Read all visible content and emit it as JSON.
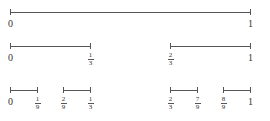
{
  "rows": [
    {
      "y": 12,
      "segments": [
        [
          10,
          250
        ]
      ],
      "labels": [
        {
          "x": 10,
          "text": "0",
          "type": "int"
        },
        {
          "x": 250,
          "text": "1",
          "type": "int"
        }
      ]
    },
    {
      "y": 46,
      "segments": [
        [
          10,
          90
        ],
        [
          170,
          250
        ]
      ],
      "labels": [
        {
          "x": 10,
          "text": "0",
          "type": "int"
        },
        {
          "x": 90,
          "num": "1",
          "den": "3",
          "type": "frac"
        },
        {
          "x": 170,
          "num": "2",
          "den": "3",
          "type": "frac"
        },
        {
          "x": 250,
          "text": "1",
          "type": "int"
        }
      ]
    },
    {
      "y": 90,
      "segments": [
        [
          10,
          37
        ],
        [
          63,
          90
        ],
        [
          170,
          197
        ],
        [
          223,
          250
        ]
      ],
      "labels": [
        {
          "x": 10,
          "text": "0",
          "type": "int"
        },
        {
          "x": 37,
          "num": "1",
          "den": "9",
          "type": "frac"
        },
        {
          "x": 63,
          "num": "2",
          "den": "9",
          "type": "frac"
        },
        {
          "x": 90,
          "num": "1",
          "den": "3",
          "type": "frac"
        },
        {
          "x": 170,
          "num": "2",
          "den": "3",
          "type": "frac"
        },
        {
          "x": 197,
          "num": "7",
          "den": "9",
          "type": "frac"
        },
        {
          "x": 223,
          "num": "8",
          "den": "9",
          "type": "frac"
        },
        {
          "x": 250,
          "text": "1",
          "type": "int"
        }
      ]
    }
  ],
  "colors": {
    "line": "#555555",
    "text": "#333333",
    "background": "#ffffff"
  }
}
